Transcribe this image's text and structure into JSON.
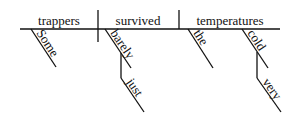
{
  "diagram": {
    "type": "reed-kellogg-sentence-diagram",
    "sentence": "Some trappers barely just survived the very cold temperatures",
    "subject": "trappers",
    "verb": "survived",
    "object": "temperatures",
    "modifiers": {
      "subject": [
        "Some"
      ],
      "verb": [
        "barely"
      ],
      "verb_modifier_modifier": [
        "just"
      ],
      "object": [
        "the",
        "cold"
      ],
      "object_modifier_modifier": [
        "very"
      ]
    }
  }
}
